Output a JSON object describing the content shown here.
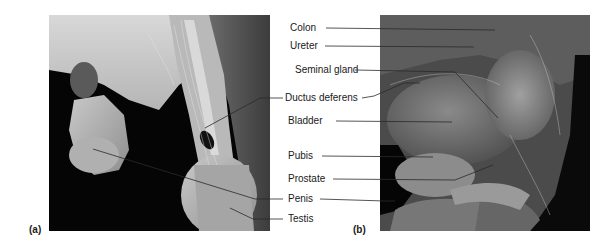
{
  "figure": {
    "panels": [
      {
        "id": "a",
        "letter": "(a)"
      },
      {
        "id": "b",
        "letter": "(b)"
      }
    ],
    "labels": [
      {
        "text": "Colon",
        "panel": "b"
      },
      {
        "text": "Ureter",
        "panel": "b"
      },
      {
        "text": "Seminal gland",
        "panel": "b"
      },
      {
        "text": "Ductus deferens",
        "panel": "a,b"
      },
      {
        "text": "Bladder",
        "panel": "b"
      },
      {
        "text": "Pubis",
        "panel": "b"
      },
      {
        "text": "Prostate",
        "panel": "b"
      },
      {
        "text": "Penis",
        "panel": "a,b"
      },
      {
        "text": "Testis",
        "panel": "a"
      }
    ]
  }
}
